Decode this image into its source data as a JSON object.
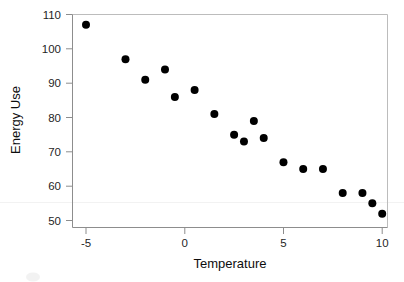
{
  "chart_data": {
    "type": "scatter",
    "title": "",
    "xlabel": "Temperature",
    "ylabel": "Energy Use",
    "xlim": [
      -6.0,
      10.8
    ],
    "ylim": [
      48.0,
      110.5
    ],
    "xticks": [
      -5,
      0,
      5,
      10
    ],
    "xticklabels": [
      "-5",
      "0",
      "5",
      "10"
    ],
    "yticks": [
      50,
      60,
      70,
      80,
      90,
      100,
      110
    ],
    "yticklabels": [
      "50",
      "60",
      "70",
      "80",
      "90",
      "100",
      "110"
    ],
    "grid": false,
    "legend": null,
    "marker": "filled-circle",
    "marker_color": "#000000",
    "marker_size_px": 4,
    "x": [
      -5,
      -3,
      -2,
      -1,
      -0.5,
      0.5,
      1.5,
      2.5,
      3,
      3.5,
      4,
      5,
      6,
      7,
      8,
      9,
      9.5,
      10
    ],
    "y": [
      107,
      97,
      91,
      94,
      86,
      88,
      81,
      75,
      73,
      79,
      74,
      67,
      65,
      65,
      58,
      58,
      55,
      52
    ],
    "points": [
      {
        "x": -5,
        "y": 107
      },
      {
        "x": -3,
        "y": 97
      },
      {
        "x": -2,
        "y": 91
      },
      {
        "x": -1,
        "y": 94
      },
      {
        "x": -0.5,
        "y": 86
      },
      {
        "x": 0.5,
        "y": 88
      },
      {
        "x": 1.5,
        "y": 81
      },
      {
        "x": 2.5,
        "y": 75
      },
      {
        "x": 3,
        "y": 73
      },
      {
        "x": 3.5,
        "y": 79
      },
      {
        "x": 4,
        "y": 74
      },
      {
        "x": 5,
        "y": 67
      },
      {
        "x": 6,
        "y": 65
      },
      {
        "x": 7,
        "y": 65
      },
      {
        "x": 8,
        "y": 58
      },
      {
        "x": 9,
        "y": 58
      },
      {
        "x": 9.5,
        "y": 55
      },
      {
        "x": 10,
        "y": 52
      }
    ],
    "n_points": 18,
    "trend": "negative",
    "annotations": []
  },
  "axes": {
    "x_title": "Temperature",
    "y_title": "Energy Use"
  },
  "colors": {
    "background": "#ffffff",
    "marker": "#000000",
    "axis": "#8d8d8d",
    "frame": "#bcbcbc",
    "text": "#1f1f1f"
  },
  "ticklabels": {
    "y": [
      "110",
      "100",
      "90",
      "80",
      "70",
      "60",
      "50"
    ],
    "x": [
      "-5",
      "0",
      "5",
      "10"
    ]
  }
}
